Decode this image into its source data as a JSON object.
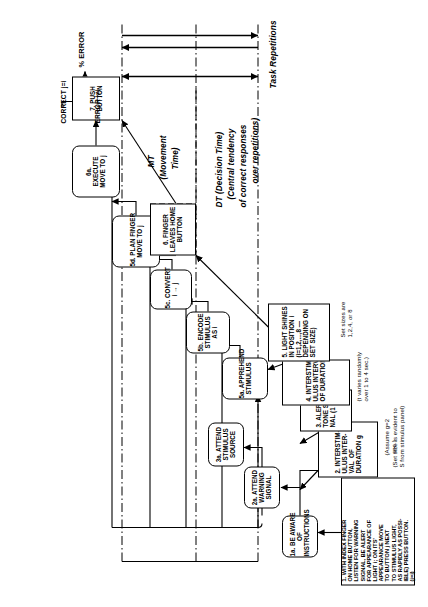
{
  "figure": {
    "title": "INSTRUCTIONS",
    "kind": "information-processing flowchart of a choice reaction-time task"
  },
  "instructions_box": {
    "lines": [
      "1. WITH INDEX FINGER",
      "ON HOME BUTTON,",
      "LISTEN FOR WARNING",
      "SIGNAL, BE ALERT",
      "FOR APPEARANCE OF",
      "LIGHT i; ON ITS'",
      "APPEARANCE MOVE",
      "TO BUTTON j NEXT",
      "TO STIMULUS LIGHT,",
      "AS RAPIDLY AS POSSI-",
      "IBLE) PRESS BUTTON.",
      "(j=i)"
    ]
  },
  "notes": {
    "set_size_evident": "(Set size is evident to\nS from stimulus panel)",
    "assume_g": "(Assume g=2\n sec.)",
    "t_varies": "(t varies randomly\nover 1 to 4 sec.)",
    "set_sizes": "Set sizes are\n1,2,4, or 8"
  },
  "stimulus_boxes": [
    {
      "id": "2",
      "lines": [
        "2. INTERSTIM-",
        "ULUS INTER-",
        "VAL  OF",
        "DURATION g"
      ]
    },
    {
      "id": "3",
      "lines": [
        "3. ALERTING",
        "TONE SIG-",
        "NAL (1 sec.)"
      ]
    },
    {
      "id": "4",
      "lines": [
        "4. INTERSTIM-",
        "ULUS INTERVAL",
        "OF DURATION t"
      ]
    },
    {
      "id": "5",
      "lines": [
        "5. LIGHT SHINES",
        "IN POSITION i",
        "(i=1,2,...,8 —",
        "DEPENDING ON",
        "SET SIZE)"
      ]
    }
  ],
  "process_boxes": [
    {
      "id": "1a",
      "lines": [
        "1a. BE AWARE",
        "OF",
        "INSTRUCTIONS"
      ]
    },
    {
      "id": "2a",
      "lines": [
        "2a. ATTEND",
        "WARNING",
        "SIGNAL"
      ]
    },
    {
      "id": "3a",
      "lines": [
        "3a. ATTEND",
        "STIMULUS",
        "SOURCE"
      ]
    },
    {
      "id": "5a",
      "lines": [
        "5a. APPREHEND",
        "STIMULUS"
      ]
    },
    {
      "id": "5b",
      "lines": [
        "5b. ENCODE",
        "STIMULUS",
        "AS i"
      ]
    },
    {
      "id": "5c",
      "lines": [
        "5c. CONVERT",
        "i → j"
      ]
    },
    {
      "id": "5d",
      "lines": [
        "5d. PLAN FINGER",
        "MOVE TO j"
      ]
    },
    {
      "id": "6a",
      "lines": [
        "6a.",
        "EXECUTE",
        "MOVE TO j"
      ]
    }
  ],
  "response_boxes": [
    {
      "id": "6",
      "lines": [
        "6. FINGER",
        "LEAVES HOME",
        "BUTTON"
      ]
    },
    {
      "id": "7",
      "lines": [
        "7. PUSH",
        "BUTTON"
      ]
    }
  ],
  "measures": {
    "dt": "DT (Decision Time)",
    "dt_sub1": "(Central tendency",
    "dt_sub2": "of correct responses",
    "dt_sub3": "over repetitions)",
    "mt": "MT",
    "mt_sub1": "(Movement",
    "mt_sub2": "Time)",
    "repetitions": "Task Repetitions"
  },
  "outcome": {
    "correct": "CORRECT j=i",
    "error": "ERROR j≠i",
    "pct_error": "% ERROR"
  },
  "colors": {
    "ink": "#000000",
    "paper": "#ffffff"
  }
}
